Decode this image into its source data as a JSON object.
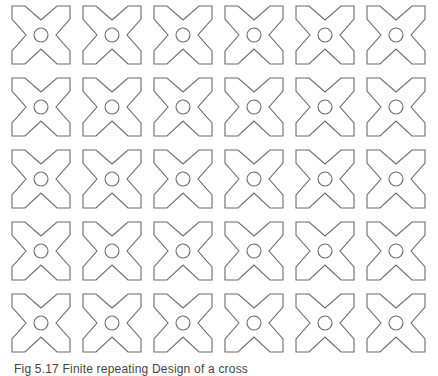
{
  "figure": {
    "pattern": {
      "rows": 5,
      "columns": 6,
      "first_center": [
        41,
        35
      ],
      "spacing": [
        71,
        72
      ],
      "motif": "x-cross-with-center-circle",
      "stroke_color": "#6b6b6b",
      "fill_color": "#ffffff",
      "background": "#ffffff"
    },
    "caption": "Fig 5.17 Finite repeating Design of a cross"
  }
}
